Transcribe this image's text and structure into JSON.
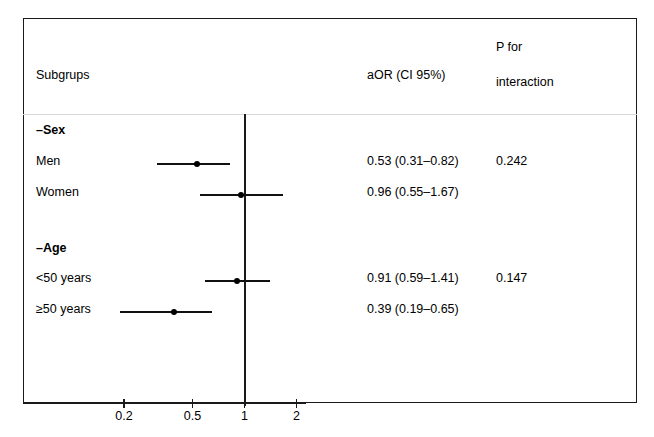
{
  "header": {
    "subgroups_label": "Subgrups",
    "aor_label": "aOR (CI 95%)",
    "p_interaction_line1": "P for",
    "p_interaction_line2": "interaction"
  },
  "rows": [
    {
      "label": "–Sex",
      "type": "group",
      "aor_text": "",
      "p_interaction": ""
    },
    {
      "label": "Men",
      "type": "data",
      "aor_text": "0.53 (0.31–0.82)",
      "p_interaction": "0.242"
    },
    {
      "label": "Women",
      "type": "data",
      "aor_text": "0.96 (0.55–1.67)",
      "p_interaction": ""
    },
    {
      "label": "–Age",
      "type": "group",
      "aor_text": "",
      "p_interaction": ""
    },
    {
      "label": "<50 years",
      "type": "data",
      "aor_text": "0.91 (0.59–1.41)",
      "p_interaction": "0.147"
    },
    {
      "label": "≥50 years",
      "type": "data",
      "aor_text": "0.39 (0.19–0.65)",
      "p_interaction": ""
    }
  ],
  "axis": {
    "tick_labels": [
      "0.2",
      "0.5",
      "1",
      "2"
    ],
    "tick_values": [
      0.2,
      0.5,
      1,
      2
    ],
    "scale": "log",
    "reference_value": 1
  },
  "colors": {
    "frame": "#1a1a1a",
    "separator": "#d9d9d9",
    "marker": "#000000",
    "text": "#000000",
    "background": "#ffffff"
  },
  "chart_data": {
    "type": "scatter",
    "chart_subtype": "forest-plot",
    "title": "",
    "xlabel": "",
    "ylabel": "",
    "xscale": "log",
    "xlim": [
      0.14,
      2.6
    ],
    "xticks": [
      0.2,
      0.5,
      1,
      2
    ],
    "xticklabels": [
      "0.2",
      "0.5",
      "1",
      "2"
    ],
    "grid": false,
    "legend": "none",
    "reference_line": 1,
    "columns": [
      "Subgrups",
      "aOR (CI 95%)",
      "P for interaction"
    ],
    "groups": [
      {
        "name": "–Sex",
        "p_interaction": 0.242,
        "entries": [
          {
            "label": "Men",
            "aor": 0.53,
            "ci_low": 0.31,
            "ci_high": 0.82,
            "aor_text": "0.53 (0.31–0.82)"
          },
          {
            "label": "Women",
            "aor": 0.96,
            "ci_low": 0.55,
            "ci_high": 1.67,
            "aor_text": "0.96 (0.55–1.67)"
          }
        ]
      },
      {
        "name": "–Age",
        "p_interaction": 0.147,
        "entries": [
          {
            "label": "<50 years",
            "aor": 0.91,
            "ci_low": 0.59,
            "ci_high": 1.41,
            "aor_text": "0.91 (0.59–1.41)"
          },
          {
            "label": "≥50 years",
            "aor": 0.39,
            "ci_low": 0.19,
            "ci_high": 0.65,
            "aor_text": "0.39 (0.19–0.65)"
          }
        ]
      }
    ]
  },
  "layout": {
    "row_y": {
      "sex_group": 131,
      "men": 161,
      "women": 192,
      "age_group": 249,
      "lt50": 278,
      "gte50": 309
    }
  }
}
